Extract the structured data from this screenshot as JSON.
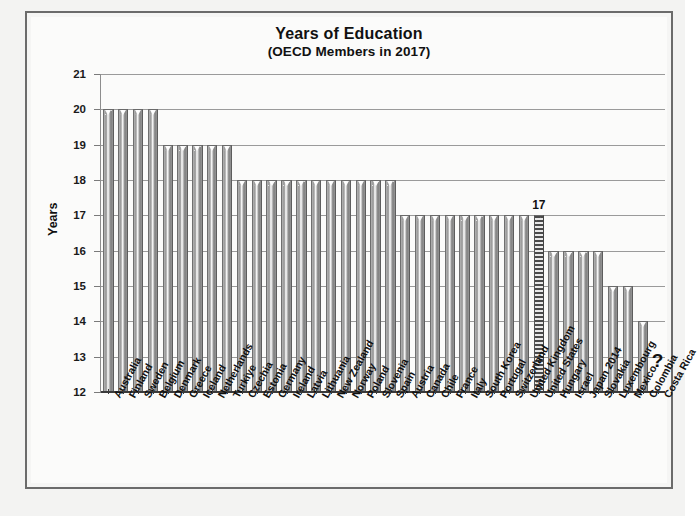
{
  "chart_data": {
    "type": "bar",
    "title": "Years of Education",
    "subtitle": "(OECD Members in 2017)",
    "xlabel": "",
    "ylabel": "Years",
    "ylim": [
      12,
      21
    ],
    "yticks": [
      12,
      13,
      14,
      15,
      16,
      17,
      18,
      19,
      20,
      21
    ],
    "grid": true,
    "legend": "none",
    "highlight_category": "United States",
    "highlight_value_label": "17",
    "missing_marker": "?",
    "missing_category": "Costa Rica",
    "categories": [
      "Australia",
      "Finland",
      "Sweden",
      "Belgium",
      "Denmark",
      "Greece",
      "Iceland",
      "Netherlands",
      "Turkiye",
      "Czechia",
      "Estonia",
      "Germany",
      "Ireland",
      "Latvia",
      "Lithuania",
      "New Zealand",
      "Norway",
      "Poland",
      "Slovenia",
      "Spain",
      "Austria",
      "Canada",
      "Chile",
      "France",
      "Italy",
      "South Korea",
      "Portugal",
      "Switzerland",
      "United Kingdom",
      "United States",
      "Hungary",
      "Israel",
      "Japan 2014",
      "Slovakia",
      "Luxembourg",
      "Mexico",
      "Colombia",
      "Costa Rica"
    ],
    "values": [
      20,
      20,
      20,
      20,
      19,
      19,
      19,
      19,
      19,
      18,
      18,
      18,
      18,
      18,
      18,
      18,
      18,
      18,
      18,
      18,
      17,
      17,
      17,
      17,
      17,
      17,
      17,
      17,
      17,
      17,
      16,
      16,
      16,
      16,
      15,
      15,
      14,
      null
    ]
  }
}
